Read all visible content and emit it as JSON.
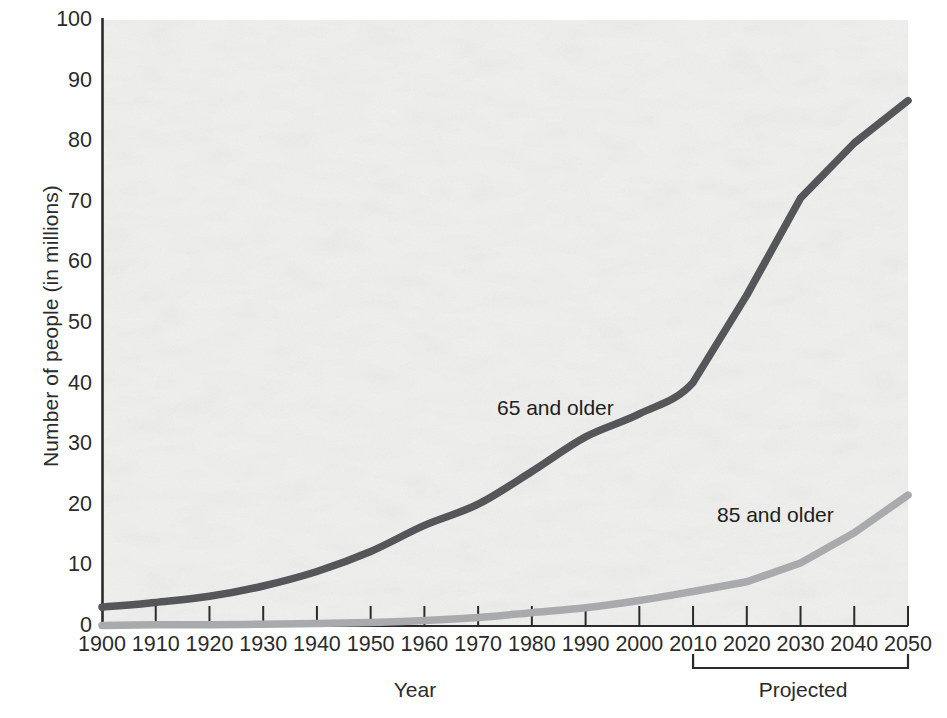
{
  "chart_data": {
    "type": "line",
    "title": "",
    "xlabel": "Year",
    "ylabel": "Number of people (in millions)",
    "xlim": [
      1900,
      2050
    ],
    "ylim": [
      0,
      100
    ],
    "grid": false,
    "legend_position": "inline-annotation",
    "x": [
      1900,
      1910,
      1920,
      1930,
      1940,
      1950,
      1960,
      1970,
      1980,
      1990,
      2000,
      2010,
      2020,
      2030,
      2040,
      2050
    ],
    "xtick_labels": [
      "1900",
      "1910",
      "1920",
      "1930",
      "1940",
      "1950",
      "1960",
      "1970",
      "1980",
      "1990",
      "2000",
      "2010",
      "2020",
      "2030",
      "2040",
      "2050"
    ],
    "ytick_labels": [
      "0",
      "10",
      "20",
      "30",
      "40",
      "50",
      "60",
      "70",
      "80",
      "90",
      "100"
    ],
    "ytick_values": [
      0,
      10,
      20,
      30,
      40,
      50,
      60,
      70,
      80,
      90,
      100
    ],
    "series": [
      {
        "name": "65 and older",
        "color": "#55565a",
        "values": [
          3.1,
          3.9,
          4.9,
          6.6,
          9.0,
          12.3,
          16.6,
          20.1,
          25.5,
          31.2,
          35.0,
          40.2,
          54.6,
          70.6,
          79.7,
          86.7
        ]
      },
      {
        "name": "85 and older",
        "color": "#a8aaad",
        "values": [
          0.1,
          0.2,
          0.2,
          0.3,
          0.4,
          0.6,
          0.9,
          1.4,
          2.2,
          3.0,
          4.2,
          5.7,
          7.3,
          10.4,
          15.4,
          21.6
        ]
      }
    ],
    "annotations": [
      {
        "text": "65 and older",
        "x": 1973,
        "y": 38
      },
      {
        "text": "85 and older",
        "x": 2016,
        "y": 19
      }
    ],
    "brackets": [
      {
        "label": "Projected",
        "from": 2010,
        "to": 2050
      }
    ]
  },
  "axes": {
    "x_title": "Year",
    "y_title": "Number of people (in millions)",
    "projected_label": "Projected"
  },
  "colors": {
    "series_65": "#55565a",
    "series_85": "#a8aaad",
    "axis": "#2b2b2b",
    "plot_background": "#f0f0ee",
    "page_background": "#ffffff"
  }
}
